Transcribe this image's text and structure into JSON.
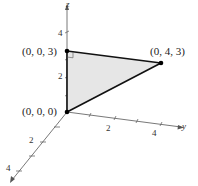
{
  "diagram": {
    "type": "3d-coordinate-triangle",
    "axes": {
      "x": "x",
      "y": "y",
      "z": "z"
    },
    "ticks": {
      "z": [
        "2",
        "4"
      ],
      "y": [
        "2",
        "4"
      ],
      "x": [
        "2",
        "4"
      ]
    },
    "points": [
      {
        "label": "(0, 0, 3)"
      },
      {
        "label": "(0, 4, 3)"
      },
      {
        "label": "(0, 0, 0)"
      }
    ],
    "fill_color": "#e6e6e6",
    "edge_color": "#111111",
    "right_angle_marker": true
  }
}
